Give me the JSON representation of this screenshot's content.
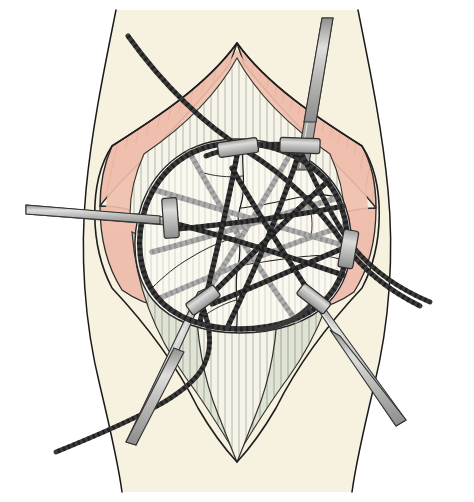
{
  "figure": {
    "title": "Patellar fracture fixation: circumferential cerclage wire with transverse Kirschner wires",
    "domain_label": "surgical-illustration",
    "width": 474,
    "height": 502,
    "background_color": "#ffffff"
  },
  "palette": {
    "background": "#ffffff",
    "skin_fill": "#f7f2e0",
    "skin_outline": "#1a1a1a",
    "subcutaneous_pink": "#efbfad",
    "subcutaneous_pink_dark": "#e3a894",
    "subcutaneous_outline": "#2b2b2b",
    "tendon_fill": "#f4f2e6",
    "tendon_striation": "#6b6b5e",
    "retinaculum_fill": "#dfe3d4",
    "retinaculum_outline": "#31352c",
    "bone_fill": "#f8f6ec",
    "bone_outline": "#262626",
    "fracture_line": "#1c1c1c",
    "wire_foreground": "#3a3a3a",
    "wire_background": "#a8a8a8",
    "metal_pin_fill": "#b6b6b6",
    "metal_pin_highlight": "#d8d8d8",
    "metal_pin_outline": "#333333",
    "crimp_fill": "#b9b9b9",
    "crimp_outline": "#2e2e2e"
  },
  "anatomy": {
    "skin": {
      "name": "Leg skin surface",
      "description": "Pale cream skin field spanning full height with sinuous lateral contour lines on both sides"
    },
    "incision": {
      "name": "Longitudinal midline incision",
      "description": "Diamond / lens shaped opening retracted to expose the patella"
    },
    "subcutaneous": {
      "name": "Retracted subcutaneous and fascial flaps",
      "description": "Salmon pink tissue margins with short hatch striations running perpendicular to the incision edge"
    },
    "quadriceps_tendon": {
      "name": "Quadriceps tendon",
      "description": "Pale fibrous band entering superiorly with dense vertical striations"
    },
    "patellar_tendon": {
      "name": "Patellar tendon",
      "description": "Pale fibrous band exiting inferiorly with dense vertical striations, converging to a point"
    },
    "retinaculum": {
      "name": "Medial and lateral retinaculum",
      "description": "Pale sage green fanning tissue on either side below the patella"
    },
    "patella": {
      "name": "Patella",
      "description": "Roughly circular bone centred in the wound, comminuted with branching fracture lines"
    },
    "fracture": {
      "name": "Comminuted patellar fracture",
      "description": "Irregular branching fracture lines crossing the bone vertically and transversely"
    }
  },
  "hardware": {
    "cerclage_ring": {
      "name": "Circumferential cerclage wire",
      "description": "Braided dark cable encircling the patella in a closed loop",
      "color": "#3a3a3a"
    },
    "foreground_wires": {
      "name": "Anterior crossing cerclage cables",
      "count": 6,
      "color": "#3a3a3a",
      "description": "Dark braided cables crossing the anterior face of the patella forming a star pattern"
    },
    "background_wires": {
      "name": "Posterior / deep crossing cables",
      "count": 5,
      "color": "#a8a8a8",
      "description": "Lighter grey braided cables seen through the bone, deeper plane"
    },
    "pins": [
      {
        "id": "pin-left-transverse",
        "name": "Transverse Kirschner wire, medial",
        "entry": "left lateral skin",
        "direction": "horizontal, slightly descending to the right"
      },
      {
        "id": "pin-top-right",
        "name": "Kirschner wire, superior",
        "entry": "superior, through quadriceps region",
        "direction": "near vertical, angled slightly left descending"
      },
      {
        "id": "pin-bottom-left",
        "name": "Kirschner wire, inferomedial",
        "entry": "inferior left of patella",
        "direction": "descending to lower left"
      },
      {
        "id": "pin-bottom-right",
        "name": "Kirschner wire, inferolateral",
        "entry": "inferior right of patella",
        "direction": "descending to lower right"
      }
    ],
    "free_wire_ends": [
      {
        "id": "wire-end-upper-left",
        "name": "Cerclage cable free end, superolateral",
        "direction": "exits to upper left beyond the skin"
      },
      {
        "id": "wire-end-right",
        "name": "Cerclage cable free end, lateral",
        "direction": "exits to the right beyond the skin"
      },
      {
        "id": "wire-end-lower-left",
        "name": "Cerclage cable free end, inferomedial",
        "direction": "exits to the lower left beyond the skin"
      }
    ],
    "crimps": [
      {
        "id": "crimp-top-left",
        "name": "Crimp sleeve, superomedial",
        "x": 238,
        "y": 148
      },
      {
        "id": "crimp-top-right",
        "name": "Crimp sleeve, superolateral",
        "x": 300,
        "y": 145
      },
      {
        "id": "crimp-left",
        "name": "Crimp sleeve, medial",
        "x": 170,
        "y": 218
      },
      {
        "id": "crimp-right",
        "name": "Crimp sleeve, lateral",
        "x": 348,
        "y": 248
      },
      {
        "id": "crimp-bottom-left",
        "name": "Crimp sleeve, inferomedial",
        "x": 203,
        "y": 300
      },
      {
        "id": "crimp-bottom-right",
        "name": "Crimp sleeve, inferolateral",
        "x": 313,
        "y": 298
      }
    ]
  }
}
